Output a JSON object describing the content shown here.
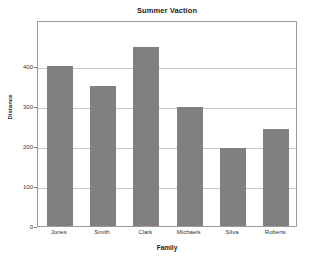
{
  "chart_data": {
    "type": "bar",
    "title": "Summer Vaction",
    "xlabel": "Family",
    "ylabel": "Distance",
    "categories": [
      "Jones",
      "Smith",
      "Clark",
      "Michaels",
      "Silva",
      "Roberts"
    ],
    "values": [
      400,
      350,
      448,
      297,
      194,
      243
    ],
    "yticks": [
      0,
      100,
      200,
      300,
      400
    ],
    "ytick_labels": [
      "0",
      "100",
      "200",
      "300",
      "400"
    ],
    "ylim": [
      0,
      515
    ],
    "xlim_note": "categorical",
    "grid": "horizontal",
    "legend": null,
    "bar_color": "#808080",
    "frame_color": "#9a9a9a",
    "grid_color": "#c8c8c8",
    "background": "#ffffff"
  }
}
